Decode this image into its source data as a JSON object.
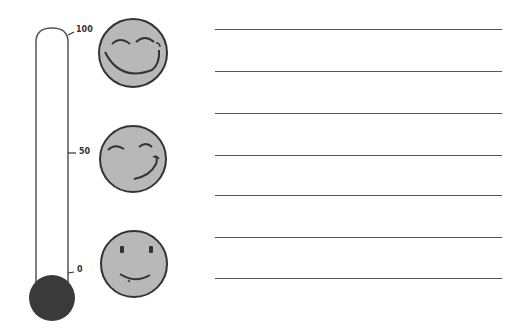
{
  "thermometer": {
    "ticks": [
      {
        "label": "100",
        "y": 32
      },
      {
        "label": "50",
        "y": 153
      },
      {
        "label": "0",
        "y": 272
      }
    ],
    "bulb_color": "#3a3a3a",
    "tube_stroke": "#555555"
  },
  "faces": [
    {
      "name": "very-happy-face",
      "cy": 53
    },
    {
      "name": "content-face",
      "cy": 159
    },
    {
      "name": "neutral-smile-face",
      "cy": 264
    }
  ],
  "face_fill": "#b8b8b8",
  "writing_lines": [
    29,
    71,
    113,
    155,
    195,
    237,
    278
  ]
}
